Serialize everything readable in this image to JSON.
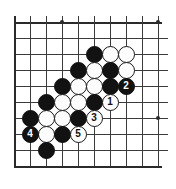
{
  "figure": {
    "name": "go-board-diagram",
    "type": "go-board",
    "board_size": 19,
    "visible_region": "bottom-left corner portion, 10 columns by 10 rows",
    "colors": {
      "board_background": "#ffffff",
      "grid_line": "#3b3b3b",
      "edge_line": "#2a2a2a",
      "black_stone": "#121212",
      "white_stone": "#fdfdfd",
      "white_stone_outline": "#1a1a1a",
      "black_number_text": "#ffffff",
      "white_number_text": "#111111"
    }
  },
  "geometry": {
    "cell_px": 16,
    "origin_x": 14,
    "origin_y": 22,
    "cols": 10,
    "rows": 10,
    "stone_diameter_px": 17
  },
  "hoshi_points": [
    {
      "name": "star-point-top-left",
      "col": 3,
      "row": 0
    },
    {
      "name": "star-point-top-right",
      "col": 9,
      "row": 0
    },
    {
      "name": "star-point-right-mid",
      "col": 9,
      "row": 6
    }
  ],
  "stones": [
    {
      "name": "stone-black-c5r2",
      "color": "black",
      "col": 5,
      "row": 2,
      "label": ""
    },
    {
      "name": "stone-white-c6r2",
      "color": "white",
      "col": 6,
      "row": 2,
      "label": ""
    },
    {
      "name": "stone-white-c7r2",
      "color": "white",
      "col": 7,
      "row": 2,
      "label": ""
    },
    {
      "name": "stone-black-c4r3",
      "color": "black",
      "col": 4,
      "row": 3,
      "label": ""
    },
    {
      "name": "stone-white-c5r3",
      "color": "white",
      "col": 5,
      "row": 3,
      "label": ""
    },
    {
      "name": "stone-black-c6r3",
      "color": "black",
      "col": 6,
      "row": 3,
      "label": ""
    },
    {
      "name": "stone-white-c7r3",
      "color": "white",
      "col": 7,
      "row": 3,
      "label": ""
    },
    {
      "name": "stone-black-c3r4",
      "color": "black",
      "col": 3,
      "row": 4,
      "label": ""
    },
    {
      "name": "stone-white-c4r4",
      "color": "white",
      "col": 4,
      "row": 4,
      "label": ""
    },
    {
      "name": "stone-white-c5r4",
      "color": "white",
      "col": 5,
      "row": 4,
      "label": ""
    },
    {
      "name": "stone-black-c6r4",
      "color": "black",
      "col": 6,
      "row": 4,
      "label": ""
    },
    {
      "name": "stone-black-move-2",
      "color": "black",
      "col": 7,
      "row": 4,
      "label": "2"
    },
    {
      "name": "stone-black-c2r5",
      "color": "black",
      "col": 2,
      "row": 5,
      "label": ""
    },
    {
      "name": "stone-white-c3r5",
      "color": "white",
      "col": 3,
      "row": 5,
      "label": ""
    },
    {
      "name": "stone-white-c4r5",
      "color": "white",
      "col": 4,
      "row": 5,
      "label": ""
    },
    {
      "name": "stone-black-c5r5",
      "color": "black",
      "col": 5,
      "row": 5,
      "label": ""
    },
    {
      "name": "stone-white-move-1",
      "color": "white",
      "col": 6,
      "row": 5,
      "label": "1"
    },
    {
      "name": "stone-black-c1r6",
      "color": "black",
      "col": 1,
      "row": 6,
      "label": ""
    },
    {
      "name": "stone-white-c2r6",
      "color": "white",
      "col": 2,
      "row": 6,
      "label": ""
    },
    {
      "name": "stone-white-c3r6",
      "color": "white",
      "col": 3,
      "row": 6,
      "label": ""
    },
    {
      "name": "stone-black-c4r6",
      "color": "black",
      "col": 4,
      "row": 6,
      "label": ""
    },
    {
      "name": "stone-white-move-3",
      "color": "white",
      "col": 5,
      "row": 6,
      "label": "3"
    },
    {
      "name": "stone-black-move-4",
      "color": "black",
      "col": 1,
      "row": 7,
      "label": "4"
    },
    {
      "name": "stone-white-c2r7",
      "color": "white",
      "col": 2,
      "row": 7,
      "label": ""
    },
    {
      "name": "stone-black-c3r7",
      "color": "black",
      "col": 3,
      "row": 7,
      "label": ""
    },
    {
      "name": "stone-white-move-5",
      "color": "white",
      "col": 4,
      "row": 7,
      "label": "5"
    },
    {
      "name": "stone-black-c2r8",
      "color": "black",
      "col": 2,
      "row": 8,
      "label": ""
    }
  ],
  "move_numbers": [
    {
      "number": "1",
      "color": "white"
    },
    {
      "number": "2",
      "color": "black"
    },
    {
      "number": "3",
      "color": "white"
    },
    {
      "number": "4",
      "color": "black"
    },
    {
      "number": "5",
      "color": "white"
    }
  ]
}
